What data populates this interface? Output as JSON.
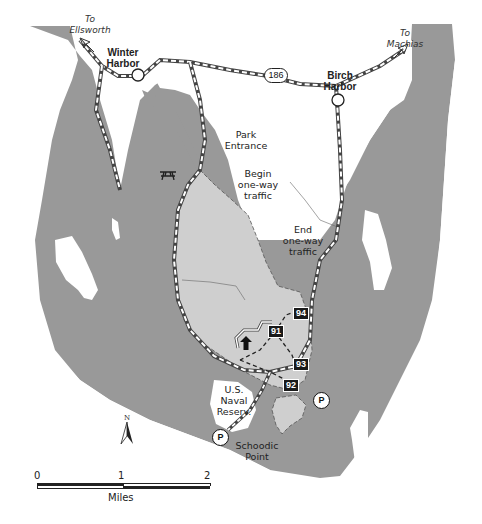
{
  "map": {
    "title": "Schoodic Peninsula",
    "colors": {
      "water": "#999999",
      "land": "#ffffff",
      "park": "#cfcfcf",
      "road": "#444444"
    },
    "towns": [
      {
        "name_line1": "Winter",
        "name_line2": "Harbor"
      },
      {
        "name_line1": "Birch",
        "name_line2": "Harbor"
      }
    ],
    "directions": [
      {
        "line1": "To",
        "line2": "Ellsworth"
      },
      {
        "line1": "To",
        "line2": "Machias"
      }
    ],
    "route_number": "186",
    "annotations": {
      "park_entrance": {
        "line1": "Park",
        "line2": "Entrance"
      },
      "begin_one_way": {
        "line1": "Begin",
        "line2": "one-way",
        "line3": "traffic"
      },
      "end_one_way": {
        "line1": "End",
        "line2": "one-way",
        "line3": "traffic"
      },
      "naval_reserve": {
        "line1": "U.S.",
        "line2": "Naval",
        "line3": "Reserv."
      },
      "schoodic_point": {
        "line1": "Schoodic",
        "line2": "Point"
      }
    },
    "hike_markers": [
      "91",
      "92",
      "93",
      "94"
    ],
    "parking_label": "P",
    "icons": [
      "picnic-area-icon",
      "trailhead-arrow-icon",
      "parking-icon",
      "north-arrow-icon"
    ]
  },
  "compass": {
    "label": "N"
  },
  "scale_bar": {
    "ticks": [
      "0",
      "1",
      "2"
    ],
    "unit": "Miles"
  }
}
